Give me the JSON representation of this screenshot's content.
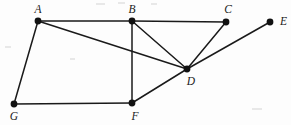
{
  "figure": {
    "background_color": "#fdfdfd",
    "edge_color": "#1a1a1a",
    "vertex_color": "#111111",
    "label_color": "#1a1a1a"
  },
  "vertices": [
    {
      "id": "A",
      "label": "A",
      "x": 38,
      "y": 21,
      "label_x": 38,
      "label_y": 13,
      "label_anchor": "middle"
    },
    {
      "id": "B",
      "label": "B",
      "x": 132,
      "y": 21,
      "label_x": 132,
      "label_y": 13,
      "label_anchor": "middle"
    },
    {
      "id": "C",
      "label": "C",
      "x": 226,
      "y": 22,
      "label_x": 228,
      "label_y": 13,
      "label_anchor": "middle"
    },
    {
      "id": "E",
      "label": "E",
      "x": 270,
      "y": 22,
      "label_x": 280,
      "label_y": 25,
      "label_anchor": "start"
    },
    {
      "id": "D",
      "label": "D",
      "x": 187,
      "y": 69,
      "label_x": 191,
      "label_y": 85,
      "label_anchor": "middle"
    },
    {
      "id": "G",
      "label": "G",
      "x": 14,
      "y": 104,
      "label_x": 14,
      "label_y": 120,
      "label_anchor": "middle"
    },
    {
      "id": "F",
      "label": "F",
      "x": 132,
      "y": 103,
      "label_x": 135,
      "label_y": 120,
      "label_anchor": "middle"
    }
  ],
  "edges": [
    {
      "id": "AB",
      "from": "A",
      "to": "B",
      "x1": 38,
      "y1": 21,
      "x2": 132,
      "y2": 21
    },
    {
      "id": "BC",
      "from": "B",
      "to": "C",
      "x1": 132,
      "y1": 21,
      "x2": 226,
      "y2": 22
    },
    {
      "id": "AG",
      "from": "A",
      "to": "G",
      "x1": 38,
      "y1": 21,
      "x2": 14,
      "y2": 104
    },
    {
      "id": "GF",
      "from": "G",
      "to": "F",
      "x1": 14,
      "y1": 104,
      "x2": 132,
      "y2": 103
    },
    {
      "id": "BF",
      "from": "B",
      "to": "F",
      "x1": 132,
      "y1": 21,
      "x2": 132,
      "y2": 103
    },
    {
      "id": "AD",
      "from": "A",
      "to": "D",
      "x1": 38,
      "y1": 21,
      "x2": 187,
      "y2": 69
    },
    {
      "id": "BD",
      "from": "B",
      "to": "D",
      "x1": 132,
      "y1": 21,
      "x2": 187,
      "y2": 69
    },
    {
      "id": "CD",
      "from": "C",
      "to": "D",
      "x1": 226,
      "y1": 22,
      "x2": 187,
      "y2": 69
    },
    {
      "id": "FD",
      "from": "F",
      "to": "D",
      "x1": 132,
      "y1": 103,
      "x2": 187,
      "y2": 69
    },
    {
      "id": "DE",
      "from": "D",
      "to": "E",
      "x1": 187,
      "y1": 69,
      "x2": 270,
      "y2": 22
    }
  ],
  "vertex_radius": 3.4,
  "specks": [
    {
      "x": 96,
      "y": 3,
      "w": 9,
      "h": 2
    },
    {
      "x": 118,
      "y": 2,
      "w": 7,
      "h": 2
    },
    {
      "x": 151,
      "y": 3,
      "w": 6,
      "h": 2
    },
    {
      "x": 5,
      "y": 46,
      "w": 6,
      "h": 2
    },
    {
      "x": 70,
      "y": 58,
      "w": 5,
      "h": 2
    },
    {
      "x": 252,
      "y": 108,
      "w": 10,
      "h": 2
    }
  ]
}
